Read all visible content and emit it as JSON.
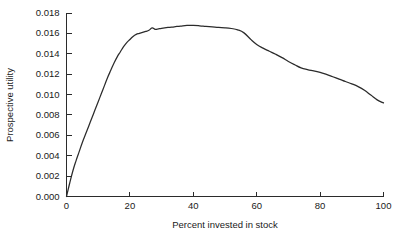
{
  "chart_data": {
    "type": "line",
    "title": "",
    "xlabel": "Percent invested in stock",
    "ylabel": "Prospective utility",
    "xlim": [
      0,
      100
    ],
    "ylim": [
      0.0,
      0.018
    ],
    "grid": false,
    "legend": false,
    "xticks": [
      "0",
      "20",
      "40",
      "60",
      "80",
      "100"
    ],
    "xtick_values": [
      0,
      20,
      40,
      60,
      80,
      100
    ],
    "yticks": [
      "0.000",
      "0.002",
      "0.004",
      "0.006",
      "0.008",
      "0.010",
      "0.012",
      "0.014",
      "0.016",
      "0.018"
    ],
    "ytick_values": [
      0.0,
      0.002,
      0.004,
      0.006,
      0.008,
      0.01,
      0.012,
      0.014,
      0.016,
      0.018
    ],
    "series": [
      {
        "name": "Prospective utility",
        "color": "#2b2b2b",
        "x": [
          0,
          1,
          2,
          3,
          4,
          5,
          6,
          7,
          8,
          9,
          10,
          11,
          12,
          13,
          14,
          15,
          16,
          17,
          18,
          19,
          20,
          21,
          22,
          23,
          24,
          25,
          26,
          27,
          28,
          29,
          30,
          32,
          34,
          36,
          38,
          40,
          42,
          44,
          46,
          48,
          50,
          52,
          54,
          56,
          58,
          60,
          62,
          64,
          66,
          68,
          70,
          72,
          74,
          76,
          78,
          80,
          82,
          84,
          86,
          88,
          90,
          92,
          94,
          96,
          98,
          100
        ],
        "y": [
          0.0,
          0.0013,
          0.0025,
          0.0035,
          0.0044,
          0.0053,
          0.0061,
          0.0069,
          0.0077,
          0.0085,
          0.0093,
          0.0101,
          0.0109,
          0.0117,
          0.0124,
          0.0131,
          0.0137,
          0.0142,
          0.0147,
          0.0151,
          0.0154,
          0.0157,
          0.0159,
          0.016,
          0.0161,
          0.0162,
          0.0163,
          0.01655,
          0.0164,
          0.01645,
          0.0165,
          0.01658,
          0.01665,
          0.01672,
          0.01678,
          0.01678,
          0.01674,
          0.01668,
          0.01663,
          0.01658,
          0.01655,
          0.01648,
          0.01635,
          0.01605,
          0.01545,
          0.01492,
          0.01455,
          0.01425,
          0.01395,
          0.01362,
          0.01325,
          0.01292,
          0.01262,
          0.01245,
          0.01232,
          0.01218,
          0.01198,
          0.01175,
          0.01152,
          0.01128,
          0.01105,
          0.01078,
          0.01042,
          0.00995,
          0.00948,
          0.00918
        ]
      }
    ]
  },
  "axes": {
    "y_title": "Prospective utility",
    "x_title": "Percent invested in stock"
  }
}
